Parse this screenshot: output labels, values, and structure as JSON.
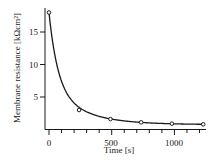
{
  "chart_data": {
    "type": "line",
    "title": "",
    "xlabel": "Time [s]",
    "ylabel": "Membrane resistance [kΩcm²]",
    "x": [
      0,
      240,
      490,
      735,
      980,
      1230
    ],
    "series": [
      {
        "name": "Membrane resistance (measured)",
        "marker": "open-circle",
        "values": [
          18.0,
          3.0,
          1.6,
          1.1,
          0.9,
          0.8
        ]
      },
      {
        "name": "Exponential fit",
        "style": "solid-line",
        "values": "smooth decay curve through points"
      }
    ],
    "xlim": [
      -40,
      1250
    ],
    "ylim": [
      0,
      18.5
    ],
    "xticks_major": [
      0,
      500,
      1000
    ],
    "xticks_minor_step": 100,
    "yticks_major": [
      5,
      10,
      15
    ],
    "grid": false,
    "legend": "none"
  },
  "axes": {
    "x_tick_labels": [
      "0",
      "500",
      "1000"
    ],
    "y_tick_labels": [
      "5",
      "10",
      "15"
    ],
    "xlabel": "Time [s]",
    "ylabel": "Membrane resistance [kΩcm²]"
  },
  "colors": {
    "line": "#1a1a1a",
    "background": "#ffffff"
  }
}
